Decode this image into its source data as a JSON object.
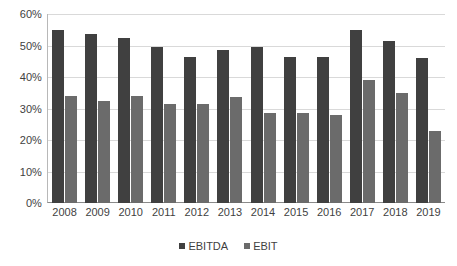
{
  "chart_data": {
    "type": "bar",
    "title": "",
    "xlabel": "",
    "ylabel": "",
    "ylim": [
      0,
      60
    ],
    "ytick_labels": [
      "0%",
      "10%",
      "20%",
      "30%",
      "40%",
      "50%",
      "60%"
    ],
    "ytick_values": [
      0,
      10,
      20,
      30,
      40,
      50,
      60
    ],
    "grid": true,
    "legend_position": "bottom",
    "categories": [
      "2008",
      "2009",
      "2010",
      "2011",
      "2012",
      "2013",
      "2014",
      "2015",
      "2016",
      "2017",
      "2018",
      "2019"
    ],
    "series": [
      {
        "name": "EBITDA",
        "color": "#404040",
        "values": [
          55.0,
          53.5,
          52.5,
          49.5,
          46.5,
          48.5,
          49.5,
          46.5,
          46.5,
          55.0,
          51.5,
          46.0
        ]
      },
      {
        "name": "EBIT",
        "color": "#6b6b6b",
        "values": [
          34.0,
          32.5,
          34.0,
          31.5,
          31.5,
          33.5,
          28.5,
          28.5,
          28.0,
          39.0,
          35.0,
          23.0
        ]
      }
    ]
  },
  "legend": {
    "items": [
      {
        "label": "EBITDA",
        "color": "#404040"
      },
      {
        "label": "EBIT",
        "color": "#6b6b6b"
      }
    ]
  },
  "style": {
    "gridline_color": "#d9d9d9",
    "axis_color": "#8a8a8a",
    "text_color": "#3f3f3f",
    "background": "#ffffff"
  }
}
